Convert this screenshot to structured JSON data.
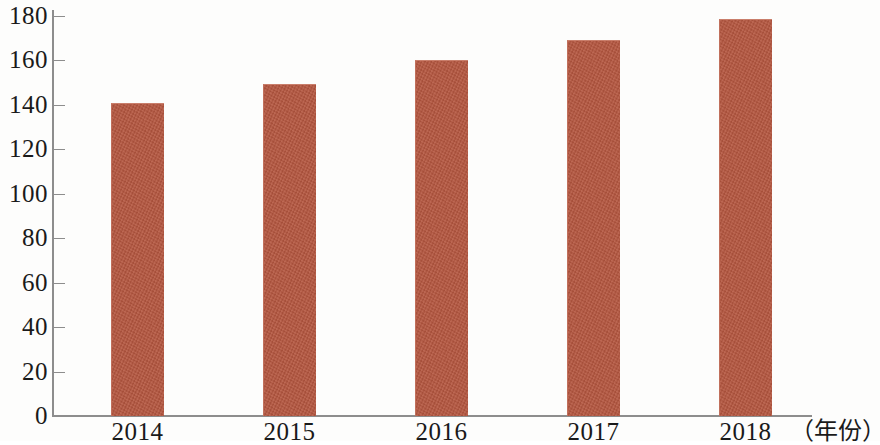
{
  "chart_data": {
    "type": "bar",
    "title": "",
    "subtitle": "",
    "xlabel": "（年份）",
    "ylabel": "",
    "categories": [
      "2014",
      "2015",
      "2016",
      "2017",
      "2018"
    ],
    "values": [
      141,
      149.5,
      160,
      169,
      178.5
    ],
    "series": [
      {
        "name": "",
        "values": [
          141,
          149.5,
          160,
          169,
          178.5
        ]
      }
    ],
    "ylim": [
      0,
      180
    ],
    "xlim": null,
    "y_ticks": [
      0,
      20,
      40,
      60,
      80,
      100,
      120,
      140,
      160,
      180
    ],
    "y_tick_labels": [
      "0",
      "20",
      "40",
      "60",
      "80",
      "100",
      "120",
      "140",
      "160",
      "180"
    ],
    "x_tick_labels": [
      "2014",
      "2015",
      "2016",
      "2017",
      "2018"
    ],
    "grid": false,
    "legend": null,
    "legend_position": "none",
    "annotations": [],
    "bar_color": "#b5563f",
    "axis_color": "#8d8d8d",
    "background_color": "#fdfdfc"
  },
  "axis": {
    "caption": "（年份）"
  }
}
